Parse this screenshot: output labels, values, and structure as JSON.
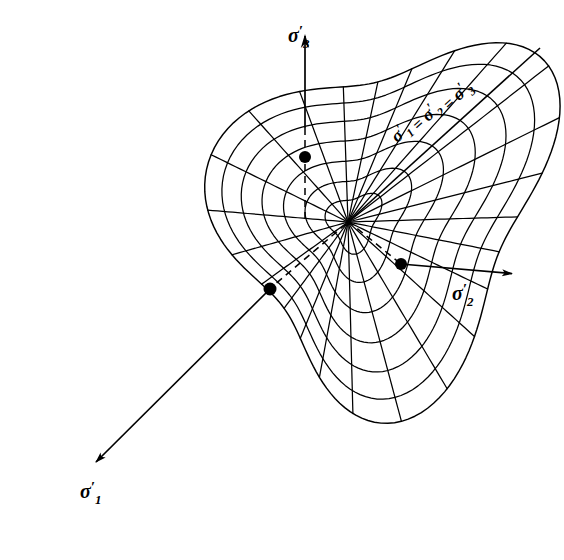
{
  "figure": {
    "background_color": "#ffffff",
    "line_color": "#000000"
  },
  "axes": [
    {
      "id": "sigma3",
      "name": "sigma-3-axis",
      "label_base": "σ",
      "label_prime": "′",
      "label_sub": "3",
      "label_text": "σ′3",
      "label_x": 288,
      "label_y": 42,
      "direction": "up",
      "arrow_tip_x": 305,
      "arrow_tip_y": 34,
      "origin_x": 348,
      "origin_y": 222,
      "solid_from_y": 34,
      "dashed_from_y": 128,
      "dashed_to_y": 222
    },
    {
      "id": "sigma2",
      "name": "sigma-2-axis",
      "label_base": "σ",
      "label_prime": "′",
      "label_sub": "2",
      "label_text": "σ′2",
      "label_x": 452,
      "label_y": 300,
      "direction": "right-down",
      "arrow_tip_x": 521,
      "arrow_tip_y": 272,
      "origin_x": 348,
      "origin_y": 222,
      "dashed_to_x": 401,
      "dashed_to_y": 264
    },
    {
      "id": "sigma1",
      "name": "sigma-1-axis",
      "label_base": "σ",
      "label_prime": "′",
      "label_sub": "1",
      "label_text": "σ′1",
      "label_x": 80,
      "label_y": 498,
      "direction": "down-left",
      "arrow_tip_x": 88,
      "arrow_tip_y": 470,
      "origin_x": 348,
      "origin_y": 222,
      "dashed_to_x": 270,
      "dashed_to_y": 289
    }
  ],
  "hydrostatic_axis": {
    "name": "hydrostatic-axis",
    "label_text": "σ′1 = σ′2 = σ′3",
    "parts": [
      "σ",
      "′",
      "1",
      " = ",
      "σ",
      "′",
      "2",
      " = ",
      "σ",
      "′",
      "3"
    ],
    "from_x": 348,
    "from_y": 222,
    "to_x": 540,
    "to_y": 48,
    "label_x": 432,
    "label_y": 112,
    "label_rotation": -42
  },
  "surface": {
    "name": "yield-surface-mesh",
    "type": "conical yield surface",
    "apex_x": 348,
    "apex_y": 222,
    "meridian_count": 24,
    "ring_count": 7,
    "stroke_width": 1.3
  },
  "markers": [
    {
      "name": "intersection-point-sigma3",
      "x": 305,
      "y": 157,
      "r": 6.0
    },
    {
      "name": "intersection-point-sigma2",
      "x": 401,
      "y": 264,
      "r": 6.0
    },
    {
      "name": "intersection-point-sigma1",
      "x": 270,
      "y": 289,
      "r": 6.5
    }
  ]
}
